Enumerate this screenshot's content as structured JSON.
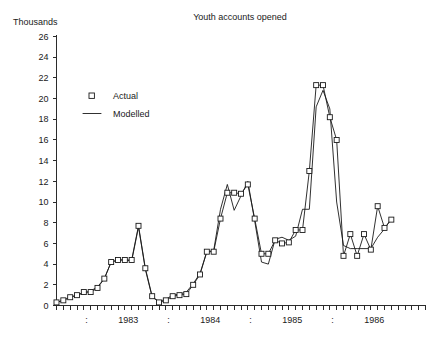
{
  "chart_data": {
    "type": "line",
    "title": "Youth accounts opened",
    "ylabel": "Thousands",
    "xlabel": "",
    "ylim": [
      0,
      26
    ],
    "ytick_step": 2,
    "yticks": [
      0,
      2,
      4,
      6,
      8,
      10,
      12,
      14,
      16,
      18,
      20,
      22,
      24,
      26
    ],
    "ytick_labels": [
      "0",
      "2",
      "4",
      "6",
      "8",
      "10",
      "12",
      "14",
      "16",
      "18",
      "20",
      "22",
      "24",
      "26"
    ],
    "grid": false,
    "legend_position": "upper-left-inside",
    "x_axis_kind": "monthly-time-series",
    "x_year_labels": [
      "1983",
      "1984",
      "1985",
      "1986"
    ],
    "x_separator_glyph": ":",
    "x_start_label": "1982-08",
    "x_end_label": "1986-03",
    "n_points": 44,
    "x": [
      "1982-08",
      "1982-09",
      "1982-10",
      "1982-11",
      "1982-12",
      "1983-01",
      "1983-02",
      "1983-03",
      "1983-04",
      "1983-05",
      "1983-06",
      "1983-07",
      "1983-08",
      "1983-09",
      "1983-10",
      "1983-11",
      "1983-12",
      "1984-01",
      "1984-02",
      "1984-03",
      "1984-04",
      "1984-05",
      "1984-06",
      "1984-07",
      "1984-08",
      "1984-09",
      "1984-10",
      "1984-11",
      "1984-12",
      "1985-01",
      "1985-02",
      "1985-03",
      "1985-04",
      "1985-05",
      "1985-06",
      "1985-07",
      "1985-08",
      "1985-09",
      "1985-10",
      "1985-11",
      "1985-12",
      "1986-01",
      "1986-02",
      "1986-03"
    ],
    "series": [
      {
        "name": "Actual",
        "style": "markers-and-line",
        "marker": "open-square",
        "values": [
          0.3,
          0.5,
          0.8,
          1.0,
          1.3,
          1.3,
          1.7,
          2.6,
          4.2,
          4.4,
          4.4,
          4.4,
          7.7,
          3.6,
          0.9,
          0.3,
          0.5,
          0.9,
          1.0,
          1.1,
          2.0,
          3.0,
          5.2,
          5.2,
          8.4,
          10.9,
          10.9,
          10.8,
          11.7,
          8.4,
          5.0,
          5.0,
          6.3,
          6.0,
          6.1,
          7.3,
          7.3,
          13.0,
          21.3,
          21.3,
          18.2,
          16.0,
          4.8,
          6.9
        ]
      },
      {
        "name": "Modelled",
        "style": "line",
        "values": [
          0.3,
          0.5,
          0.8,
          1.0,
          1.2,
          1.4,
          1.8,
          2.6,
          4.2,
          4.4,
          4.4,
          4.3,
          7.6,
          3.5,
          0.8,
          0.4,
          0.6,
          1.0,
          1.1,
          1.3,
          2.1,
          3.1,
          5.2,
          5.3,
          9.3,
          11.7,
          9.2,
          10.6,
          12.0,
          8.2,
          4.2,
          4.0,
          6.4,
          6.6,
          6.3,
          6.7,
          9.3,
          9.3,
          19.2,
          20.8,
          19.0,
          10.0,
          5.8,
          5.5
        ]
      }
    ],
    "actual_tail": [
      4.8,
      6.9,
      5.4,
      9.6,
      7.5,
      8.3
    ],
    "modelled_tail": [
      5.5,
      5.5,
      5.5,
      6.6,
      7.4,
      8.4
    ],
    "legend": [
      {
        "label": "Actual",
        "kind": "open-square-marker"
      },
      {
        "label": "Modelled",
        "kind": "solid-line"
      }
    ],
    "colors": {
      "line": "#1a1a1a",
      "axis": "#2b2b2b",
      "marker_face": "#ffffff",
      "background": "#ffffff"
    }
  }
}
